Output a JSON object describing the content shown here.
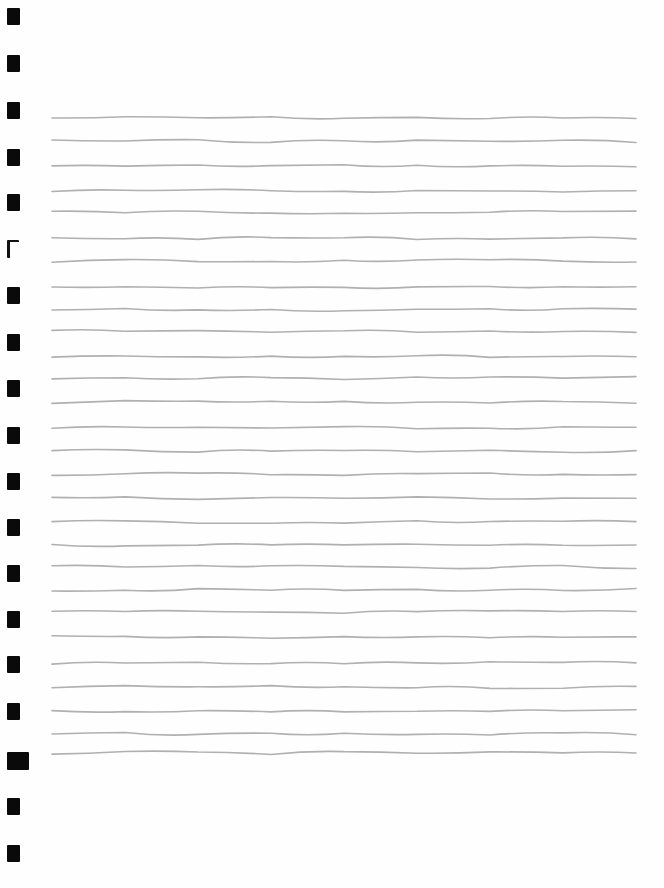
{
  "page": {
    "type": "lined-paper",
    "background": "#fefefe",
    "line_color": "#b0b0b0",
    "line_count": 29,
    "line_x_start": 52,
    "line_x_end": 636,
    "line_y": [
      118,
      141,
      166,
      191,
      212,
      238,
      261,
      288,
      310,
      331,
      356,
      378,
      402,
      428,
      451,
      474,
      498,
      522,
      545,
      567,
      590,
      612,
      637,
      663,
      687,
      711,
      734,
      753,
      755
    ]
  },
  "margin_marks": {
    "count": 17,
    "color": "#0a0a0a",
    "items": [
      {
        "y": 8,
        "h": 17,
        "w": 13,
        "style": "filled"
      },
      {
        "y": 55,
        "h": 17,
        "w": 13,
        "style": "filled"
      },
      {
        "y": 102,
        "h": 17,
        "w": 13,
        "style": "filled"
      },
      {
        "y": 149,
        "h": 17,
        "w": 13,
        "style": "filled"
      },
      {
        "y": 194,
        "h": 17,
        "w": 13,
        "style": "filled"
      },
      {
        "y": 240,
        "h": 16,
        "w": 9,
        "style": "open"
      },
      {
        "y": 287,
        "h": 17,
        "w": 13,
        "style": "filled"
      },
      {
        "y": 334,
        "h": 17,
        "w": 13,
        "style": "filled"
      },
      {
        "y": 380,
        "h": 17,
        "w": 13,
        "style": "filled"
      },
      {
        "y": 427,
        "h": 17,
        "w": 13,
        "style": "filled"
      },
      {
        "y": 473,
        "h": 17,
        "w": 13,
        "style": "filled"
      },
      {
        "y": 519,
        "h": 17,
        "w": 13,
        "style": "filled"
      },
      {
        "y": 565,
        "h": 17,
        "w": 13,
        "style": "filled"
      },
      {
        "y": 611,
        "h": 17,
        "w": 13,
        "style": "filled"
      },
      {
        "y": 656,
        "h": 17,
        "w": 13,
        "style": "filled"
      },
      {
        "y": 703,
        "h": 17,
        "w": 13,
        "style": "filled"
      },
      {
        "y": 752,
        "h": 18,
        "w": 22,
        "style": "filled"
      },
      {
        "y": 798,
        "h": 17,
        "w": 13,
        "style": "filled"
      },
      {
        "y": 845,
        "h": 17,
        "w": 13,
        "style": "filled"
      }
    ]
  }
}
